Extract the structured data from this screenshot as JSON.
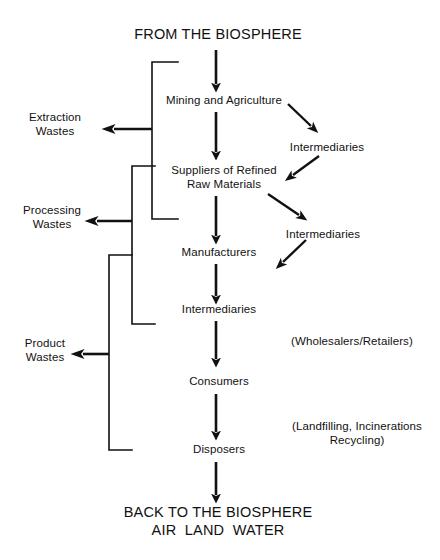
{
  "diagram": {
    "ink_color": "#111111",
    "background_color": "#ffffff",
    "headings": {
      "top": "FROM THE BIOSPHERE",
      "bottom_line1": "BACK TO THE BIOSPHERE",
      "bottom_line2": "AIR  LAND  WATER"
    },
    "chain": [
      {
        "id": "mining",
        "label": "Mining and Agriculture"
      },
      {
        "id": "suppliers_line1",
        "label": "Suppliers of Refined"
      },
      {
        "id": "suppliers_line2",
        "label": "Raw Materials"
      },
      {
        "id": "manufacturers",
        "label": "Manufacturers"
      },
      {
        "id": "intermediaries_center",
        "label": "Intermediaries"
      },
      {
        "id": "consumers",
        "label": "Consumers"
      },
      {
        "id": "disposers",
        "label": "Disposers"
      }
    ],
    "side_nodes": [
      {
        "id": "intermediaries_upper",
        "label": "Intermediaries"
      },
      {
        "id": "intermediaries_lower",
        "label": "Intermediaries"
      }
    ],
    "waste_outputs": [
      {
        "id": "extraction",
        "line1": "Extraction",
        "line2": "Wastes"
      },
      {
        "id": "processing",
        "line1": "Processing",
        "line2": "Wastes"
      },
      {
        "id": "product",
        "line1": "Product",
        "line2": "Wastes"
      }
    ],
    "annotations": [
      {
        "id": "wholesalers",
        "line1": "(Wholesalers/Retailers)",
        "line2": ""
      },
      {
        "id": "disposal_methods",
        "line1": "(Landfilling, Incinerations",
        "line2": "Recycling)"
      }
    ]
  }
}
